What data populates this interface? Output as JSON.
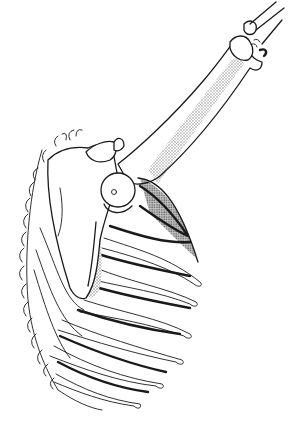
{
  "illustration": {
    "subject": "shoulder girdle with raised arm: scapula, humerus, rib cage",
    "style": "black ink line drawing with stippled shading",
    "colors": {
      "background": "#ffffff",
      "ink": "#1a1a1a",
      "stipple": "#8a8a8a"
    },
    "parts": [
      "forearm-bones",
      "elbow-joint",
      "humerus",
      "humeral-head",
      "acromion",
      "scapula",
      "rib-cage",
      "vertebral-column"
    ]
  }
}
